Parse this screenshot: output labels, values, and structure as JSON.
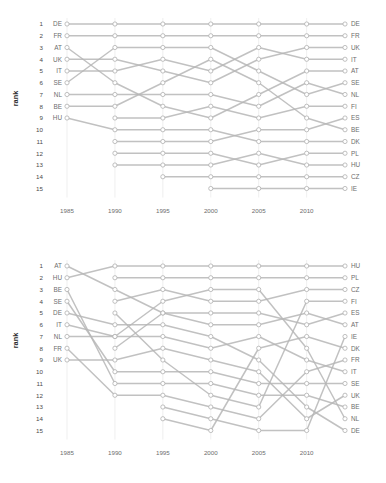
{
  "figure": {
    "type": "bump-chart-pair",
    "background": "#ffffff",
    "line_color": "#b6b6b6",
    "node_fill": "#ffffff",
    "grid_color": "#e8e8e8",
    "text_color": "#6d6d6d"
  },
  "charts": [
    {
      "id": "top",
      "ylabel": "rank",
      "xticks": [
        "1985",
        "1990",
        "1995",
        "2000",
        "2005",
        "2010"
      ],
      "ranks": [
        "1",
        "2",
        "3",
        "4",
        "5",
        "6",
        "7",
        "8",
        "9",
        "10",
        "11",
        "12",
        "13",
        "14",
        "15"
      ],
      "left_labels": [
        "DE",
        "FR",
        "AT",
        "UK",
        "IT",
        "SE",
        "NL",
        "BE",
        "HU"
      ],
      "right_labels": [
        "DE",
        "FR",
        "UK",
        "IT",
        "AT",
        "SE",
        "NL",
        "FI",
        "ES",
        "BE",
        "DK",
        "PL",
        "HU",
        "CZ",
        "IE"
      ]
    },
    {
      "id": "bottom",
      "ylabel": "rank",
      "xticks": [
        "1985",
        "1990",
        "1995",
        "2000",
        "2005",
        "2010"
      ],
      "ranks": [
        "1",
        "2",
        "3",
        "4",
        "5",
        "6",
        "7",
        "8",
        "9",
        "10",
        "11",
        "12",
        "13",
        "14",
        "15"
      ],
      "left_labels": [
        "AT",
        "HU",
        "BE",
        "SE",
        "DE",
        "IT",
        "NL",
        "FR",
        "UK"
      ],
      "right_labels": [
        "HU",
        "PL",
        "CZ",
        "FI",
        "ES",
        "AT",
        "IE",
        "DK",
        "FR",
        "IT",
        "SE",
        "UK",
        "BE",
        "NL",
        "DE"
      ]
    }
  ],
  "chart_data": [
    {
      "type": "line",
      "subtype": "bump",
      "id": "top",
      "title": "",
      "xlabel": "",
      "ylabel": "rank",
      "x": [
        1985,
        1990,
        1995,
        2000,
        2005,
        2010,
        2014
      ],
      "xtick_labels": [
        "1985",
        "1990",
        "1995",
        "2000",
        "2005",
        "2010"
      ],
      "ylim": [
        15,
        1
      ],
      "y_inverted": true,
      "grid": true,
      "legend": "none",
      "series": [
        {
          "name": "DE",
          "values": [
            1,
            1,
            1,
            1,
            1,
            1,
            1
          ]
        },
        {
          "name": "FR",
          "values": [
            2,
            2,
            2,
            2,
            2,
            2,
            2
          ]
        },
        {
          "name": "AT",
          "values": [
            3,
            6,
            8,
            9,
            7,
            5,
            5
          ]
        },
        {
          "name": "UK",
          "values": [
            4,
            4,
            5,
            6,
            4,
            3,
            3
          ]
        },
        {
          "name": "IT",
          "values": [
            5,
            5,
            4,
            5,
            3,
            4,
            4
          ]
        },
        {
          "name": "SE",
          "values": [
            6,
            3,
            3,
            3,
            5,
            7,
            6
          ]
        },
        {
          "name": "NL",
          "values": [
            7,
            7,
            7,
            7,
            8,
            6,
            7
          ]
        },
        {
          "name": "BE",
          "values": [
            8,
            8,
            6,
            4,
            6,
            9,
            10
          ]
        },
        {
          "name": "HU",
          "values": [
            9,
            10,
            10,
            10,
            11,
            11,
            11
          ]
        },
        {
          "name": "FI",
          "values": [
            null,
            9,
            9,
            8,
            9,
            8,
            8
          ]
        },
        {
          "name": "ES",
          "values": [
            null,
            11,
            11,
            11,
            10,
            10,
            9
          ]
        },
        {
          "name": "DK",
          "values": [
            null,
            12,
            12,
            12,
            13,
            12,
            12
          ]
        },
        {
          "name": "PL",
          "values": [
            null,
            13,
            13,
            13,
            12,
            13,
            13
          ]
        },
        {
          "name": "CZ",
          "values": [
            null,
            null,
            14,
            14,
            14,
            14,
            14
          ]
        },
        {
          "name": "IE",
          "values": [
            null,
            null,
            null,
            15,
            15,
            15,
            15
          ]
        }
      ]
    },
    {
      "type": "line",
      "subtype": "bump",
      "id": "bottom",
      "title": "",
      "xlabel": "",
      "ylabel": "rank",
      "x": [
        1985,
        1990,
        1995,
        2000,
        2005,
        2010,
        2014
      ],
      "xtick_labels": [
        "1985",
        "1990",
        "1995",
        "2000",
        "2005",
        "2010"
      ],
      "ylim": [
        15,
        1
      ],
      "y_inverted": true,
      "grid": true,
      "legend": "none",
      "series": [
        {
          "name": "AT",
          "values": [
            1,
            3,
            5,
            6,
            6,
            5,
            6
          ]
        },
        {
          "name": "HU",
          "values": [
            2,
            1,
            1,
            1,
            1,
            1,
            1
          ]
        },
        {
          "name": "BE",
          "values": [
            3,
            11,
            11,
            11,
            12,
            12,
            13
          ]
        },
        {
          "name": "SE",
          "values": [
            4,
            10,
            10,
            10,
            11,
            11,
            11
          ]
        },
        {
          "name": "DE",
          "values": [
            5,
            6,
            6,
            7,
            9,
            13,
            15
          ]
        },
        {
          "name": "IT",
          "values": [
            6,
            7,
            7,
            8,
            7,
            9,
            10
          ]
        },
        {
          "name": "NL",
          "values": [
            7,
            7,
            4,
            3,
            3,
            8,
            14
          ]
        },
        {
          "name": "FR",
          "values": [
            8,
            12,
            12,
            13,
            14,
            10,
            9
          ]
        },
        {
          "name": "UK",
          "values": [
            9,
            9,
            8,
            9,
            10,
            14,
            12
          ]
        },
        {
          "name": "PL",
          "values": [
            null,
            2,
            2,
            2,
            2,
            2,
            2
          ]
        },
        {
          "name": "CZ",
          "values": [
            null,
            4,
            3,
            4,
            4,
            3,
            3
          ]
        },
        {
          "name": "FI",
          "values": [
            null,
            5,
            9,
            12,
            13,
            4,
            4
          ]
        },
        {
          "name": "ES",
          "values": [
            null,
            8,
            5,
            5,
            5,
            6,
            5
          ]
        },
        {
          "name": "IE",
          "values": [
            null,
            null,
            13,
            14,
            15,
            15,
            7
          ]
        },
        {
          "name": "DK",
          "values": [
            null,
            null,
            14,
            15,
            8,
            7,
            8
          ]
        }
      ]
    }
  ]
}
